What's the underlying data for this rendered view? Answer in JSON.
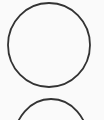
{
  "canvas": {
    "width": 104,
    "height": 120,
    "background_color": "#fafafa",
    "description": "Hand-drawn / scanned outline circles on a plain page"
  },
  "style": {
    "stroke_color": "#333333",
    "stroke_color_light": "#4a4a4a",
    "stroke_width": 1.8,
    "stroke_width_thin": 1.4,
    "fill": "none"
  },
  "shapes": [
    {
      "name": "circle-top",
      "type": "ellipse",
      "cx": 49,
      "cy": 45,
      "rx": 41,
      "ry": 42,
      "stroke": "#333333",
      "stroke_width": 1.8,
      "clipped": false,
      "label": "Full circle outline"
    },
    {
      "name": "circle-bottom",
      "type": "ellipse",
      "cx": 51,
      "cy": 141,
      "rx": 37,
      "ry": 42,
      "stroke": "#333333",
      "stroke_width": 1.8,
      "clipped": true,
      "label": "Partial circle outline cut off by page edge"
    }
  ]
}
